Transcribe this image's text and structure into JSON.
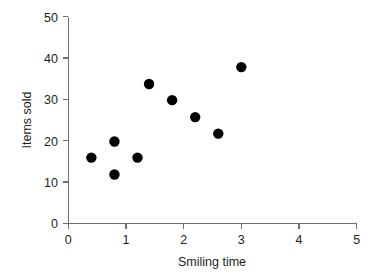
{
  "chart_data": {
    "type": "scatter",
    "title": "",
    "subtitle": "",
    "xlabel": "Smiling time",
    "ylabel": "Items sold",
    "xlim": [
      0,
      5
    ],
    "ylim": [
      0,
      50
    ],
    "xticks": [
      "0",
      "1",
      "2",
      "3",
      "4",
      "5"
    ],
    "yticks": [
      "0",
      "10",
      "20",
      "30",
      "40",
      "50"
    ],
    "xtick_values": [
      0,
      1,
      2,
      3,
      4,
      5
    ],
    "ytick_values": [
      0,
      10,
      20,
      30,
      40,
      50
    ],
    "grid": false,
    "legend": null,
    "annotations": [],
    "marker": {
      "shape": "circle",
      "color": "#000000",
      "size": 5.2
    },
    "series": [
      {
        "name": "",
        "x": [
          0.4,
          0.8,
          0.8,
          1.2,
          1.4,
          1.8,
          2.2,
          2.6,
          3.0
        ],
        "y": [
          15.9,
          19.8,
          11.8,
          15.9,
          33.7,
          29.8,
          25.7,
          21.7,
          37.8
        ]
      }
    ],
    "points": [
      {
        "x": 0.4,
        "y": 15.9
      },
      {
        "x": 0.8,
        "y": 19.8
      },
      {
        "x": 0.8,
        "y": 11.8
      },
      {
        "x": 1.2,
        "y": 15.9
      },
      {
        "x": 1.4,
        "y": 33.7
      },
      {
        "x": 1.8,
        "y": 29.8
      },
      {
        "x": 2.2,
        "y": 25.7
      },
      {
        "x": 2.6,
        "y": 21.7
      },
      {
        "x": 3.0,
        "y": 37.8
      }
    ]
  },
  "axes": {
    "x_title": "Smiling time",
    "y_title": "Items sold",
    "x_labels": [
      "0",
      "1",
      "2",
      "3",
      "4",
      "5"
    ],
    "y_labels": [
      "0",
      "10",
      "20",
      "30",
      "40",
      "50"
    ]
  },
  "colors": {
    "marker": "#000000",
    "axis": "#6d6e71",
    "text": "#231f20",
    "background": "#ffffff"
  }
}
